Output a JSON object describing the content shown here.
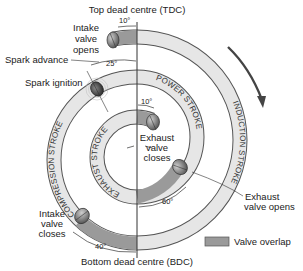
{
  "title_top": "Top dead centre (TDC)",
  "title_bottom": "Bottom dead centre (BDC)",
  "strokes": {
    "induction": "INDUCTION STROKE",
    "compression": "COMPRESSION STROKE",
    "power": "POWER STROKE",
    "exhaust": "EXHAUST STROKE"
  },
  "events": {
    "intake_opens": [
      "Intake",
      "valve",
      "opens"
    ],
    "spark_advance": "Spark advance",
    "spark_ignition": "Spark ignition",
    "exhaust_closes": [
      "Exhaust",
      "valve",
      "closes"
    ],
    "exhaust_opens": [
      "Exhaust",
      "valve opens"
    ],
    "intake_closes": [
      "Intake",
      "valve",
      "closes"
    ]
  },
  "angles": {
    "intake_open_before_tdc": "10°",
    "spark_advance": "25°",
    "exhaust_close_after_tdc": "10°",
    "exhaust_open_before_bdc": "60°",
    "intake_close_after_bdc": "40°"
  },
  "legend": {
    "valve_overlap": "Valve overlap"
  },
  "colors": {
    "band": "#e4e4e4",
    "overlap": "#9a9a9a",
    "outline": "#555555",
    "valve": "#7a7a7a",
    "arrow": "#444444"
  }
}
